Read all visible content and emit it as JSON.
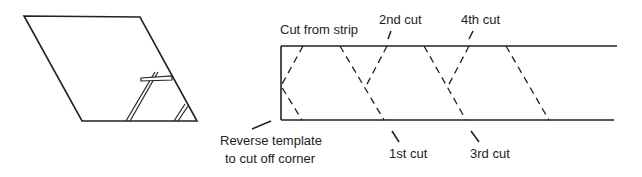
{
  "figure": {
    "colors": {
      "stroke": "#222222",
      "background": "#ffffff"
    },
    "left_template": {
      "description": "Parallelogram template with ruler placed to trim corner"
    },
    "strip": {
      "labels": {
        "top_left": "Cut from strip",
        "bottom_left_line1": "Reverse template",
        "bottom_left_line2": "to cut off corner",
        "cut1": "1st cut",
        "cut2": "2nd cut",
        "cut3": "3rd cut",
        "cut4": "4th cut"
      }
    }
  }
}
